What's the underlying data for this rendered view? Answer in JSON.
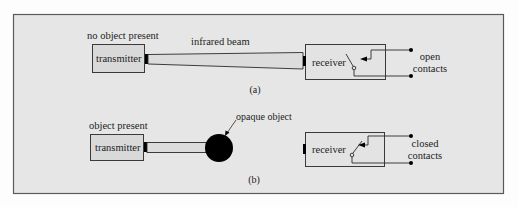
{
  "figure": {
    "panel_a": {
      "caption": "(a)",
      "state_label": "no object present",
      "beam_label": "infrared beam",
      "transmitter_label": "transmitter",
      "receiver_label": "receiver",
      "contacts_label_line1": "open",
      "contacts_label_line2": "contacts"
    },
    "panel_b": {
      "caption": "(b)",
      "state_label": "object present",
      "object_label": "opaque object",
      "transmitter_label": "transmitter",
      "receiver_label": "receiver",
      "contacts_label_line1": "closed",
      "contacts_label_line2": "contacts"
    }
  },
  "colors": {
    "frame_fill": "#e6e6e6",
    "frame_stroke": "#5a5a5a",
    "box_fill": "#d9d9d9",
    "beam_fill": "#dcdcdc",
    "object_fill": "#000000",
    "line": "#2a2a2a"
  }
}
